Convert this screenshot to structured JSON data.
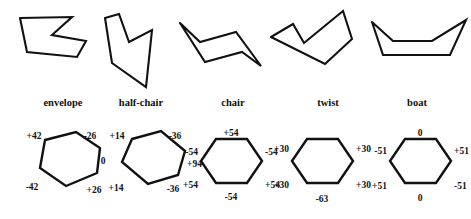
{
  "figure": {
    "stroke_color": "#111111",
    "background_color": "#ffffff"
  },
  "conformations": [
    {
      "id": "envelope",
      "label": "envelope",
      "label_x": 63,
      "label_y": 106,
      "shape_points": "20,18 27,52 77,57 86,41 52,35 72,17",
      "hexagon_points": "45,140 76,132 100,148 97,173 66,186 40,168",
      "torsion_labels": [
        {
          "name": "angle-top-left",
          "text": "+42",
          "x": 34,
          "y": 139,
          "anchor": "mid"
        },
        {
          "name": "angle-top-right",
          "text": "-26",
          "x": 90,
          "y": 139,
          "anchor": "mid"
        },
        {
          "name": "angle-right",
          "text": "0",
          "x": 103,
          "y": 164,
          "anchor": "mid"
        },
        {
          "name": "angle-bottom-right",
          "text": "+26",
          "x": 94,
          "y": 193,
          "anchor": "mid"
        },
        {
          "name": "angle-bottom-left",
          "text": "-42",
          "x": 32,
          "y": 190,
          "anchor": "mid"
        }
      ]
    },
    {
      "id": "half-chair",
      "label": "half-chair",
      "label_x": 141,
      "label_y": 106,
      "shape_points": "105,18 112,63 146,87 152,30 129,42 119,14",
      "hexagon_points": "132,139 161,131 185,151 178,175 148,184 122,162",
      "torsion_labels": [
        {
          "name": "angle-top-left",
          "text": "+14",
          "x": 117,
          "y": 139,
          "anchor": "mid"
        },
        {
          "name": "angle-top-right",
          "text": "-36",
          "x": 175,
          "y": 139,
          "anchor": "mid"
        },
        {
          "name": "angle-right",
          "text": "+94",
          "x": 187,
          "y": 167,
          "anchor": "start"
        },
        {
          "name": "angle-bottom-right",
          "text": "-36",
          "x": 173,
          "y": 192,
          "anchor": "mid"
        },
        {
          "name": "angle-bottom-left",
          "text": "+14",
          "x": 116,
          "y": 191,
          "anchor": "mid"
        }
      ]
    },
    {
      "id": "chair",
      "label": "chair",
      "label_x": 233,
      "label_y": 106,
      "shape_points": "180,23 205,62 242,52 261,66 236,32 200,42",
      "hexagon_points": "216,139 247,139 262,161 247,183 216,183 201,161",
      "torsion_labels": [
        {
          "name": "angle-top",
          "text": "+54",
          "x": 231,
          "y": 136,
          "anchor": "mid"
        },
        {
          "name": "angle-upper-left",
          "text": "-54",
          "x": 198,
          "y": 155,
          "anchor": "end"
        },
        {
          "name": "angle-upper-right",
          "text": "-54",
          "x": 265,
          "y": 155,
          "anchor": "start"
        },
        {
          "name": "angle-lower-left",
          "text": "+54",
          "x": 198,
          "y": 188,
          "anchor": "end"
        },
        {
          "name": "angle-lower-right",
          "text": "+54",
          "x": 265,
          "y": 188,
          "anchor": "start"
        },
        {
          "name": "angle-bottom",
          "text": "-54",
          "x": 231,
          "y": 200,
          "anchor": "mid"
        }
      ]
    },
    {
      "id": "twist",
      "label": "twist",
      "label_x": 328,
      "label_y": 106,
      "shape_points": "271,37 293,24 304,43 343,11 352,39 325,64",
      "hexagon_points": "307,139 338,139 353,161 338,183 307,183 292,161",
      "torsion_labels": [
        {
          "name": "angle-upper-left",
          "text": "+30",
          "x": 289,
          "y": 152,
          "anchor": "end"
        },
        {
          "name": "angle-upper-right",
          "text": "+30",
          "x": 356,
          "y": 152,
          "anchor": "start"
        },
        {
          "name": "angle-lower-left",
          "text": "+30",
          "x": 289,
          "y": 188,
          "anchor": "end"
        },
        {
          "name": "angle-lower-right",
          "text": "+30",
          "x": 356,
          "y": 188,
          "anchor": "start"
        },
        {
          "name": "angle-bottom",
          "text": "-63",
          "x": 322,
          "y": 202,
          "anchor": "mid"
        }
      ]
    },
    {
      "id": "boat",
      "label": "boat",
      "label_x": 417,
      "label_y": 106,
      "shape_points": "372,22 383,55 450,55 466,20 432,41 393,41",
      "hexagon_points": "405,139 436,139 451,161 436,183 405,183 390,161",
      "torsion_labels": [
        {
          "name": "angle-top",
          "text": "0",
          "x": 420,
          "y": 136,
          "anchor": "mid"
        },
        {
          "name": "angle-upper-left",
          "text": "-51",
          "x": 387,
          "y": 154,
          "anchor": "end"
        },
        {
          "name": "angle-upper-right",
          "text": "+51",
          "x": 454,
          "y": 154,
          "anchor": "start"
        },
        {
          "name": "angle-lower-left",
          "text": "+51",
          "x": 387,
          "y": 189,
          "anchor": "end"
        },
        {
          "name": "angle-lower-right",
          "text": "-51",
          "x": 454,
          "y": 189,
          "anchor": "start"
        },
        {
          "name": "angle-bottom",
          "text": "0",
          "x": 420,
          "y": 201,
          "anchor": "mid"
        }
      ]
    }
  ],
  "chart_data": {
    "type": "diagram",
    "series": [
      {
        "name": "envelope",
        "categories": [
          "top-left",
          "top-right",
          "right",
          "bottom-right",
          "bottom-left"
        ],
        "values": [
          42,
          -26,
          0,
          26,
          -42
        ]
      },
      {
        "name": "half-chair",
        "categories": [
          "top-left",
          "top-right",
          "right",
          "bottom-right",
          "bottom-left"
        ],
        "values": [
          14,
          -36,
          94,
          -36,
          14
        ]
      },
      {
        "name": "chair",
        "categories": [
          "top",
          "upper-left",
          "upper-right",
          "lower-left",
          "lower-right",
          "bottom"
        ],
        "values": [
          54,
          -54,
          -54,
          54,
          54,
          -54
        ]
      },
      {
        "name": "twist",
        "categories": [
          "upper-left",
          "upper-right",
          "lower-left",
          "lower-right",
          "bottom"
        ],
        "values": [
          30,
          30,
          30,
          30,
          -63
        ]
      },
      {
        "name": "boat",
        "categories": [
          "top",
          "upper-left",
          "upper-right",
          "lower-left",
          "lower-right",
          "bottom"
        ],
        "values": [
          0,
          -51,
          51,
          51,
          -51,
          0
        ]
      }
    ]
  }
}
